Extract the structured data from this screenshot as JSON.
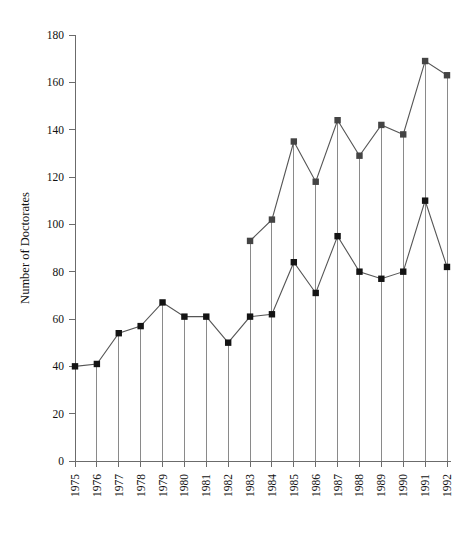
{
  "chart_data": {
    "type": "line",
    "title": "",
    "subtitle": "",
    "xlabel": "",
    "ylabel": "Number of Doctorates",
    "categories": [
      "1975",
      "1976",
      "1977",
      "1978",
      "1979",
      "1980",
      "1981",
      "1982",
      "1983",
      "1984",
      "1985",
      "1986",
      "1987",
      "1988",
      "1989",
      "1990",
      "1991",
      "1992"
    ],
    "x": [
      1975,
      1976,
      1977,
      1978,
      1979,
      1980,
      1981,
      1982,
      1983,
      1984,
      1985,
      1986,
      1987,
      1988,
      1989,
      1990,
      1991,
      1992
    ],
    "ylim": [
      0,
      180
    ],
    "xlim": [
      1975,
      1992
    ],
    "yticks": [
      0,
      20,
      40,
      60,
      80,
      100,
      120,
      140,
      160,
      180
    ],
    "ytick_labels": [
      "0",
      "20",
      "40",
      "60",
      "80",
      "100",
      "120",
      "140",
      "160",
      "180"
    ],
    "grid": false,
    "legend": "none",
    "drop_lines": true,
    "marker": "square",
    "series": [
      {
        "name": "lower-series",
        "values": [
          40,
          41,
          54,
          57,
          67,
          61,
          61,
          50,
          61,
          62,
          84,
          71,
          95,
          80,
          77,
          80,
          110,
          82
        ]
      },
      {
        "name": "upper-series",
        "values": [
          null,
          null,
          null,
          null,
          null,
          null,
          null,
          null,
          93,
          102,
          135,
          118,
          144,
          129,
          142,
          138,
          169,
          163
        ]
      }
    ],
    "annotations": []
  },
  "axes": {
    "y_axis_title": "Number of Doctorates",
    "y_tick_labels": [
      "180",
      "160",
      "140",
      "120",
      "100",
      "80",
      "60",
      "40",
      "20",
      "0"
    ],
    "x_tick_labels": [
      "1975",
      "1976",
      "1977",
      "1978",
      "1979",
      "1980",
      "1981",
      "1982",
      "1983",
      "1984",
      "1985",
      "1986",
      "1987",
      "1988",
      "1989",
      "1990",
      "1991",
      "1992"
    ]
  }
}
